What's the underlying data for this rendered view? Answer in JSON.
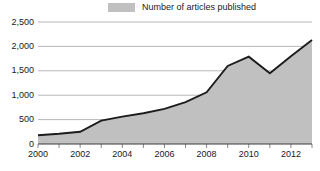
{
  "legend": {
    "label": "Number of articles published",
    "swatch_color": "#c0c0c0",
    "position": "top-center"
  },
  "colors": {
    "fill": "#c0c0c0",
    "line": "#1c1c1c",
    "gridline": "#9a9a9a",
    "axis": "#3a3a3a",
    "text": "#1a1a1a",
    "background": "#ffffff"
  },
  "axes": {
    "y_ticks": [
      "0",
      "500",
      "1,000",
      "1,500",
      "2,000",
      "2,500"
    ],
    "x_ticks": [
      "2000",
      "2002",
      "2004",
      "2006",
      "2008",
      "2010",
      "2012"
    ]
  },
  "chart_data": {
    "type": "area",
    "title": "",
    "subtitle": "",
    "xlabel": "",
    "ylabel": "",
    "categories": [
      2000,
      2001,
      2002,
      2003,
      2004,
      2005,
      2006,
      2007,
      2008,
      2009,
      2010,
      2011,
      2012,
      2013
    ],
    "series": [
      {
        "name": "Number of articles published",
        "values": [
          180,
          210,
          250,
          480,
          560,
          630,
          720,
          860,
          1060,
          1600,
          1790,
          1450,
          1800,
          2130
        ]
      }
    ],
    "xlim": [
      2000,
      2013
    ],
    "ylim": [
      0,
      2500
    ],
    "ytick_values": [
      0,
      500,
      1000,
      1500,
      2000,
      2500
    ],
    "ytick_labels": [
      "0",
      "500",
      "1,000",
      "1,500",
      "2,000",
      "2,500"
    ],
    "xtick_values": [
      2000,
      2001,
      2002,
      2003,
      2004,
      2005,
      2006,
      2007,
      2008,
      2009,
      2010,
      2011,
      2012,
      2013
    ],
    "xtick_labels": [
      "2000",
      "",
      "2002",
      "",
      "2004",
      "",
      "2006",
      "",
      "2008",
      "",
      "2010",
      "",
      "2012",
      ""
    ],
    "grid": "horizontal",
    "legend": "top-center"
  }
}
